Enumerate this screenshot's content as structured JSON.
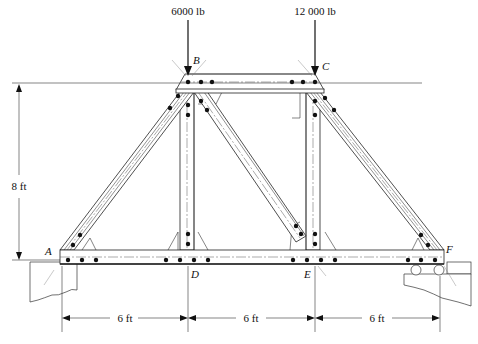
{
  "diagram": {
    "loads": [
      {
        "label": "6000 lb",
        "node": "B"
      },
      {
        "label": "12 000 lb",
        "node": "C"
      }
    ],
    "nodes": {
      "A": "A",
      "B": "B",
      "C": "C",
      "D": "D",
      "E": "E",
      "F": "F"
    },
    "dimensions": {
      "height": "8 ft",
      "spans": [
        "6 ft",
        "6 ft",
        "6 ft"
      ]
    },
    "supports": {
      "left": "pin support at A",
      "right": "roller support at F"
    },
    "members": [
      "AB",
      "BC",
      "CF",
      "AD",
      "DE",
      "EF",
      "BD",
      "BE",
      "CE"
    ]
  }
}
